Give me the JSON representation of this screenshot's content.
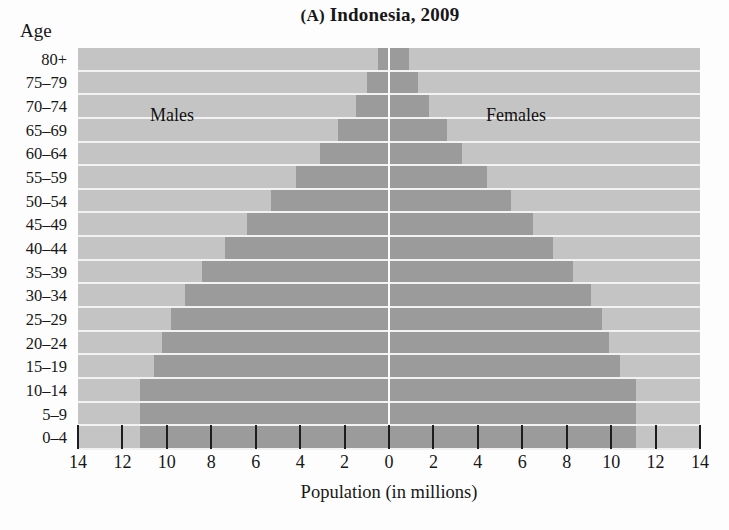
{
  "chart_data": {
    "type": "bar",
    "subtype": "population-pyramid",
    "title": "(A) Indonesia, 2009",
    "panel_letter": "(A)",
    "title_rest": " Indonesia, 2009",
    "xlabel": "Population (in millions)",
    "ylabel": "Age",
    "xlim": [
      -14,
      14
    ],
    "x_ticks": [
      14,
      12,
      10,
      8,
      6,
      4,
      2,
      0,
      2,
      4,
      6,
      8,
      10,
      12,
      14
    ],
    "x_tick_labels": [
      "14",
      "12",
      "10",
      "8",
      "6",
      "4",
      "2",
      "0",
      "2",
      "4",
      "6",
      "8",
      "10",
      "12",
      "14"
    ],
    "grid": false,
    "legend_position": "in-plot",
    "series_labels": {
      "left": "Males",
      "right": "Females"
    },
    "categories": [
      "80+",
      "75–79",
      "70–74",
      "65–69",
      "60–64",
      "55–59",
      "50–54",
      "45–49",
      "40–44",
      "35–39",
      "30–34",
      "25–29",
      "20–24",
      "15–19",
      "10–14",
      "5–9",
      "0–4"
    ],
    "series": [
      {
        "name": "Males",
        "values": [
          0.5,
          1.0,
          1.5,
          2.3,
          3.1,
          4.2,
          5.3,
          6.4,
          7.4,
          8.4,
          9.2,
          9.8,
          10.2,
          10.6,
          11.2,
          11.2,
          11.2
        ]
      },
      {
        "name": "Females",
        "values": [
          0.9,
          1.3,
          1.8,
          2.6,
          3.3,
          4.4,
          5.5,
          6.5,
          7.4,
          8.3,
          9.1,
          9.6,
          9.9,
          10.4,
          11.1,
          11.1,
          11.1
        ]
      }
    ],
    "colors": {
      "bar": "#9b9b9b",
      "plot_background": "#c4c4c4",
      "gridline": "#f2f2f2",
      "center_line": "#fbfbfb",
      "text": "#171717",
      "page_background": "#fdfdfd"
    }
  }
}
